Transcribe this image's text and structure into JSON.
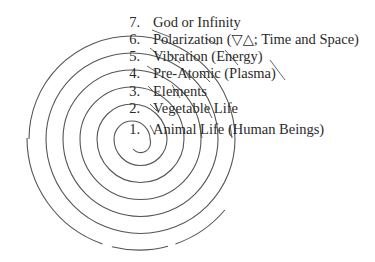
{
  "diagram": {
    "type": "spiral",
    "stroke_color": "#555555",
    "text_color": "#2a2a2a",
    "levels": [
      {
        "number": "7.",
        "label": "God or Infinity"
      },
      {
        "number": "6.",
        "label": "Polarization (▽△; Time and Space)"
      },
      {
        "number": "5.",
        "label": "Vibration (Energy)"
      },
      {
        "number": "4.",
        "label": "Pre-Atomic (Plasma)"
      },
      {
        "number": "3.",
        "label": "Elements"
      },
      {
        "number": "2.",
        "label": "Vegetable Life"
      },
      {
        "number": "1.",
        "label": "Animal Life (Human Beings)"
      }
    ]
  }
}
